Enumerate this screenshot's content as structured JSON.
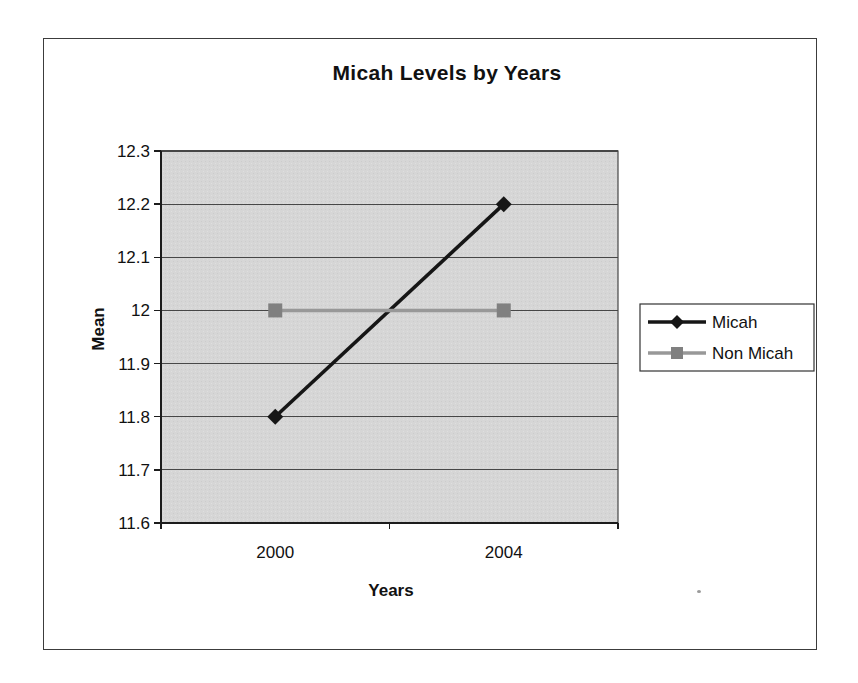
{
  "page": {
    "background": "#ffffff",
    "frame_border_color": "#3c3c3c",
    "speck_color": "#9a9a9a"
  },
  "chart_data": {
    "type": "line",
    "title": "Micah Levels by Years",
    "xlabel": "Years",
    "ylabel": "Mean",
    "categories": [
      "2000",
      "2004"
    ],
    "series": [
      {
        "name": "Micah",
        "values": [
          11.8,
          12.2
        ],
        "color": "#161616",
        "marker": "diamond",
        "marker_color": "#161616"
      },
      {
        "name": "Non Micah",
        "values": [
          12.0,
          12.0
        ],
        "color": "#989898",
        "marker": "square",
        "marker_color": "#808080"
      }
    ],
    "ylim": [
      11.6,
      12.3
    ],
    "ytick_step": 0.1,
    "ytick_labels": [
      "12.3",
      "12.2",
      "12.1",
      "12",
      "11.9",
      "11.8",
      "11.7",
      "11.6"
    ],
    "grid": true,
    "legend_position": "right",
    "legend_entries": [
      "Micah",
      "Non Micah"
    ],
    "plot_bg": "#d6d6d6",
    "gridline_color": "#474747",
    "axis_color": "#1c1c1c",
    "text_color": "#111111",
    "legend_bg": "#ffffff",
    "legend_border_color": "#333333"
  }
}
